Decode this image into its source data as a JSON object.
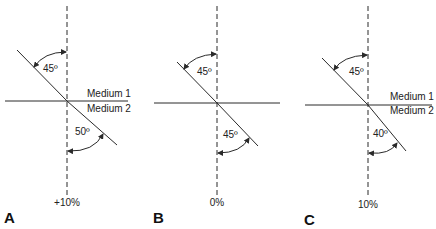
{
  "figure": {
    "panels": [
      {
        "id": "A",
        "label": "A",
        "bottom_label": "+10%",
        "incident_angle": "45º",
        "refracted_angle": "50º",
        "medium_top": "Medium 1",
        "medium_bottom": "Medium 2",
        "show_medium_labels": true
      },
      {
        "id": "B",
        "label": "B",
        "bottom_label": "0%",
        "incident_angle": "45º",
        "refracted_angle": "45º",
        "show_medium_labels": false
      },
      {
        "id": "C",
        "label": "C",
        "bottom_label": "10%",
        "incident_angle": "45º",
        "refracted_angle": "40º",
        "medium_top": "Medium 1",
        "medium_bottom": "Medium 2",
        "show_medium_labels": true
      }
    ],
    "colors": {
      "line": "#2a2a2a",
      "text": "#222222"
    }
  }
}
